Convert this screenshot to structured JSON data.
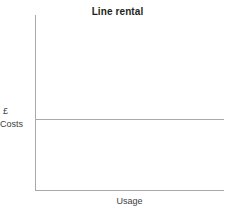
{
  "chart_data": {
    "type": "line",
    "title": "Line rental",
    "xlabel": "Usage",
    "ylabel_unit": "£",
    "ylabel_name": "Costs",
    "series": [
      {
        "name": "Line rental",
        "x": [
          0,
          100
        ],
        "values": [
          40,
          40
        ]
      }
    ],
    "xlim": [
      0,
      100
    ],
    "ylim": [
      0,
      100
    ],
    "grid": false,
    "legend": "none",
    "tick_labels_x": [],
    "tick_labels_y": [],
    "colors": {
      "axis": "#a7a9ac",
      "series": "#a7a9ac",
      "title_text": "#231f20",
      "label_text": "#414042",
      "background": "#ffffff"
    }
  }
}
